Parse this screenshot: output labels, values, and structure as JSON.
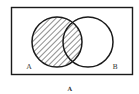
{
  "diagram": {
    "type": "venn",
    "universe_label": "",
    "sets": [
      {
        "id": "A",
        "label": "A",
        "shaded": true
      },
      {
        "id": "B",
        "label": "B",
        "shaded": false
      }
    ],
    "shaded_region": "A",
    "shading_style": "diagonal-hatch",
    "caption": "A",
    "colors": {
      "stroke": "#1a1a1a",
      "hatch": "#333333",
      "background": "#ffffff"
    }
  }
}
